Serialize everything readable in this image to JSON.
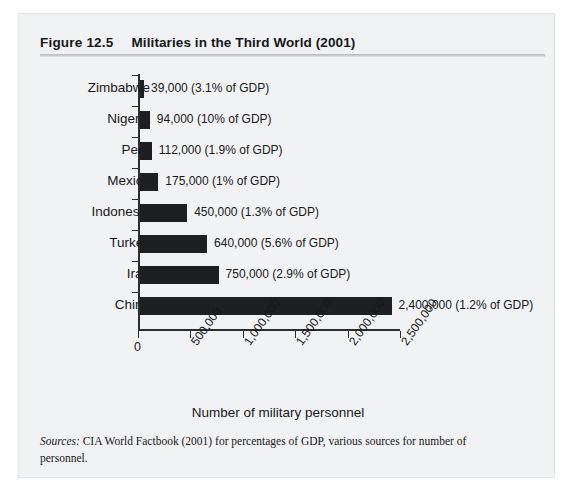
{
  "figure": {
    "number": "Figure 12.5",
    "title": "Militaries in the Third World (2001)"
  },
  "source_note": {
    "label": "Sources:",
    "text": " CIA World Factbook (2001) for percentages of GDP, various sources for number of personnel."
  },
  "chart_data": {
    "type": "bar",
    "orientation": "horizontal",
    "title": "Militaries in the Third World (2001)",
    "xlabel": "Number of military personnel",
    "ylabel": "",
    "xlim": [
      0,
      2500000
    ],
    "grid": false,
    "legend": null,
    "categories": [
      "Zimbabwe",
      "Nigeria",
      "Peru",
      "Mexico",
      "Indonesia",
      "Turkey",
      "Iran",
      "China"
    ],
    "values": [
      39000,
      94000,
      112000,
      175000,
      450000,
      640000,
      750000,
      2400000
    ],
    "value_labels": [
      "39,000 (3.1% of GDP)",
      "94,000 (10% of GDP)",
      "112,000 (1.9% of GDP)",
      "175,000 (1% of GDP)",
      "450,000 (1.3% of GDP)",
      "640,000 (5.6% of GDP)",
      "750,000 (2.9% of GDP)",
      "2,400,000 (1.2% of GDP)"
    ],
    "gdp_percent": [
      3.1,
      10,
      1.9,
      1,
      1.3,
      5.6,
      2.9,
      1.2
    ],
    "xticks": [
      0,
      500000,
      1000000,
      1500000,
      2000000,
      2500000
    ],
    "xtick_labels": [
      "0",
      "500,000",
      "1,000,000",
      "1,500,000",
      "2,000,000",
      "2,500,000"
    ],
    "bar_color": "#1d1f20",
    "background_color": "#f1f2f3"
  }
}
